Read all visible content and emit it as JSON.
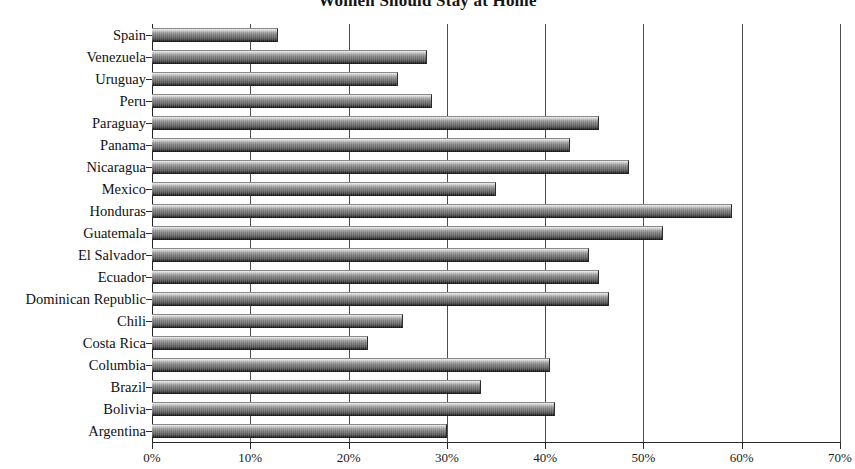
{
  "chart_data": {
    "type": "bar",
    "orientation": "horizontal",
    "title": "Women Should Stay at Home",
    "xlabel": "",
    "ylabel": "",
    "xlim": [
      0,
      70
    ],
    "grid": true,
    "legend": false,
    "xtick_labels": [
      "0%",
      "10%",
      "20%",
      "30%",
      "40%",
      "50%",
      "60%",
      "70%"
    ],
    "xticks": [
      0,
      10,
      20,
      30,
      40,
      50,
      60,
      70
    ],
    "categories": [
      "Spain",
      "Venezuela",
      "Uruguay",
      "Peru",
      "Paraguay",
      "Panama",
      "Nicaragua",
      "Mexico",
      "Honduras",
      "Guatemala",
      "El Salvador",
      "Ecuador",
      "Dominican Republic",
      "Chili",
      "Costa Rica",
      "Columbia",
      "Brazil",
      "Bolivia",
      "Argentina"
    ],
    "values": [
      12.8,
      28.0,
      25.0,
      28.5,
      45.5,
      42.5,
      48.5,
      35.0,
      59.0,
      52.0,
      44.5,
      45.5,
      46.5,
      25.5,
      22.0,
      40.5,
      33.5,
      41.0,
      30.0
    ],
    "value_suffix": "%",
    "bar_color": "#6b6b6b",
    "gridline_color": "#4d4d4d",
    "axis_color": "#2b2b2b",
    "background_color": "#ffffff"
  }
}
